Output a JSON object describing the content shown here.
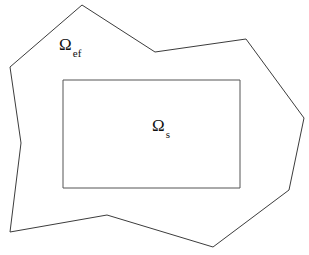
{
  "figure": {
    "background_color": "#ffffff",
    "outline_color": "#3c3c3c",
    "inner_outline_color": "#555555",
    "labels": {
      "outer": {
        "name": "omega-ef",
        "glyph": "Ω",
        "subscript": "ef",
        "description": "external fluid domain label"
      },
      "inner": {
        "name": "omega-s",
        "glyph": "Ω",
        "subscript": "s",
        "description": "solid domain label"
      }
    },
    "shapes": {
      "outer_polygon": {
        "name": "outer-domain-polygon",
        "points": "82,5 155,52 246,39 304,118 289,190 213,247 107,215 10,232 21,143 10,67"
      },
      "inner_rectangle": {
        "name": "inner-domain-rectangle",
        "x": 63,
        "y": 80,
        "width": 177,
        "height": 108
      }
    }
  }
}
